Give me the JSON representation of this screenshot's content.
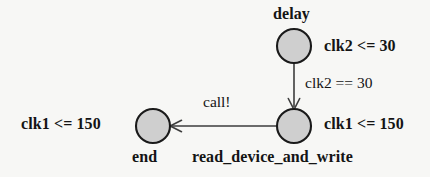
{
  "diagram": {
    "kind": "timed-automaton-state-diagram",
    "background_color": "#f7f7f5",
    "node_fill_color": "#cfcfcf",
    "node_stroke_color": "#1a1a1a",
    "edge_color": "#404040",
    "text_color": "#141414",
    "nodes": [
      {
        "id": "delay",
        "name": "delay",
        "invariant": "clk2 <= 30",
        "cx": 294,
        "cy": 46,
        "r": 17
      },
      {
        "id": "read_device_and_write",
        "name": "read_device_and_write",
        "invariant": "clk1 <= 150",
        "cx": 294,
        "cy": 126,
        "r": 17
      },
      {
        "id": "end",
        "name": "end",
        "invariant": "clk1 <= 150",
        "cx": 153,
        "cy": 126,
        "r": 17
      }
    ],
    "edges": [
      {
        "id": "delay-to-read",
        "from": "delay",
        "to": "read_device_and_write",
        "label": "clk2 == 30",
        "label_kind": "guard",
        "direction": "down"
      },
      {
        "id": "read-to-end",
        "from": "read_device_and_write",
        "to": "end",
        "label": "call!",
        "label_kind": "synchronisation",
        "direction": "left"
      }
    ]
  }
}
